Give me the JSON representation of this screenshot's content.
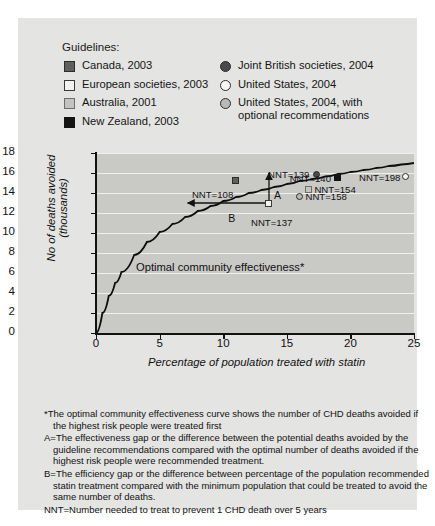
{
  "legend": {
    "title": "Guidelines:",
    "column_left": [
      {
        "label": "Canada, 2003",
        "marker": "filled-dark-square",
        "color": "#5f5f5f"
      },
      {
        "label": "European societies, 2003",
        "marker": "open-square",
        "color": "#f2f2f0"
      },
      {
        "label": "Australia, 2001",
        "marker": "light-grey-square",
        "color": "#c3c3c0"
      },
      {
        "label": "New Zealand, 2003",
        "marker": "black-square",
        "color": "#141414"
      }
    ],
    "column_right": [
      {
        "label": "Joint British societies, 2004",
        "marker": "filled-circle",
        "color": "#4a4a4a"
      },
      {
        "label": "United States, 2004",
        "marker": "open-circle",
        "color": "#f6f6f4"
      },
      {
        "label": "United States, 2004, with\noptional recommendations",
        "marker": "grey-circle",
        "color": "#b9b9b6"
      }
    ]
  },
  "chart_data": {
    "type": "line",
    "title": "",
    "xlabel": "Percentage of population treated with statin",
    "ylabel": "No of deaths avoided (thousands)",
    "xlim": [
      0,
      25
    ],
    "ylim": [
      0,
      18
    ],
    "xticks": [
      0,
      5,
      10,
      15,
      20,
      25
    ],
    "yticks": [
      0,
      2,
      4,
      6,
      8,
      10,
      12,
      14,
      16,
      18
    ],
    "grid": "horizontal",
    "curve_label": "Optimal community effectiveness*",
    "curve": {
      "name": "Optimal community effectiveness",
      "x": [
        0,
        0.5,
        1,
        1.5,
        2,
        3,
        4,
        5,
        6,
        7,
        8,
        9,
        10,
        11,
        12,
        13,
        14,
        15,
        16,
        17,
        18,
        19,
        20,
        21,
        22,
        23,
        24,
        25
      ],
      "y": [
        0,
        2.0,
        3.7,
        5.0,
        6.1,
        7.8,
        9.1,
        10.1,
        10.9,
        11.6,
        12.2,
        12.7,
        13.2,
        13.6,
        14.0,
        14.3,
        14.6,
        14.9,
        15.2,
        15.4,
        15.65,
        15.9,
        16.1,
        16.3,
        16.5,
        16.7,
        16.85,
        17.0
      ]
    },
    "points": [
      {
        "label": "NNT=108",
        "guideline": "Canada, 2003",
        "marker": "filled-dark-square",
        "x": 11.0,
        "y": 15.3
      },
      {
        "label": "NNT=137",
        "guideline": "European societies, 2003",
        "marker": "open-square",
        "x": 13.6,
        "y": 13.0
      },
      {
        "label": "NNT=139",
        "guideline": "Joint British societies, 2004",
        "marker": "filled-circle",
        "x": 17.3,
        "y": 15.9
      },
      {
        "label": "NNT=140",
        "guideline": "New Zealand, 2003",
        "marker": "black-square",
        "x": 19.0,
        "y": 15.6
      },
      {
        "label": "NNT=154",
        "guideline": "Australia, 2001",
        "marker": "light-grey-square",
        "x": 16.7,
        "y": 14.4
      },
      {
        "label": "NNT=158",
        "guideline": "United States, 2004, with optional recommendations",
        "marker": "grey-circle",
        "x": 16.0,
        "y": 13.7
      },
      {
        "label": "NNT=198",
        "guideline": "United States, 2004",
        "marker": "open-circle",
        "x": 24.3,
        "y": 15.7
      }
    ],
    "annotations": [
      {
        "id": "A",
        "label": "A",
        "type": "effectiveness-gap-arrow",
        "x": 13.6,
        "y_from": 13.0,
        "y_to": 16.0
      },
      {
        "id": "B",
        "label": "B",
        "type": "efficiency-gap-arrow",
        "y": 13.0,
        "x_from": 13.6,
        "x_to": 7.2
      }
    ]
  },
  "footnotes": [
    "*The optimal community effectiveness curve shows the number of CHD deaths avoided if the highest risk people were treated first",
    "A=The effectiveness gap or the difference between the potential deaths avoided by the guideline recommendations compared with the optimal number of deaths avoided if the highest risk people were recommended treatment.",
    "B=The efficiency gap or the difference between percentage of the population recommended statin treatment compared with the minimum population that could be treated to avoid the same number of deaths.",
    "NNT=Number needed to treat to prevent 1 CHD death over 5 years"
  ]
}
